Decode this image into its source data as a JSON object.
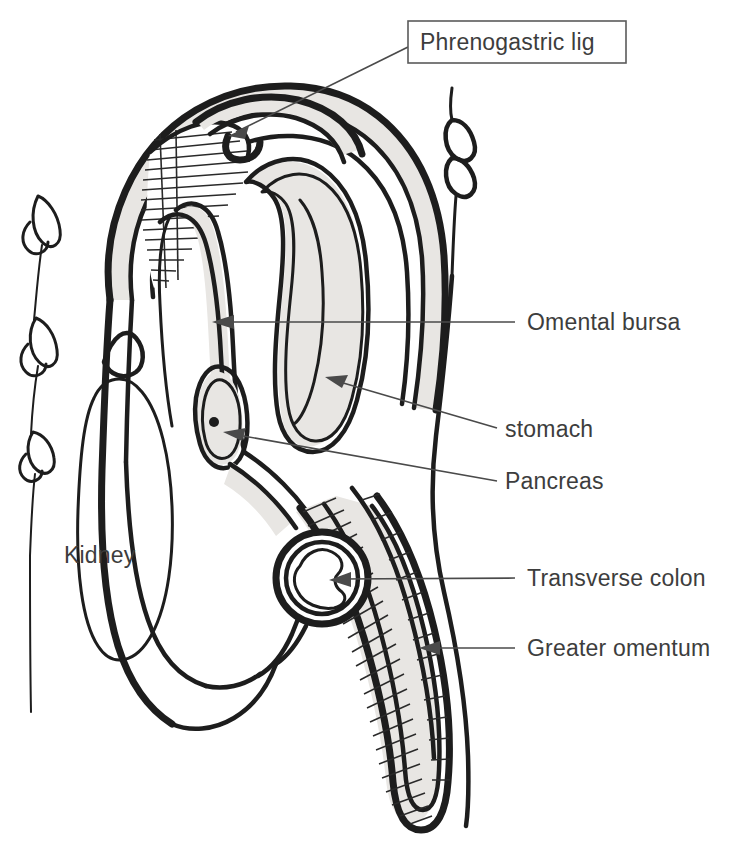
{
  "figure": {
    "background_color": "#ffffff",
    "ink_color": "#1d1d1d",
    "serosa_fill_color": "#e8e6e3",
    "label_text_color": "#3d3d3d",
    "labels": [
      {
        "id": "phrenogastric-lig",
        "text": "Phrenogastric lig",
        "boxed": true,
        "text_x": 420,
        "text_y": 48,
        "box": {
          "x": 408,
          "y": 21,
          "width": 218,
          "height": 42
        },
        "leader": {
          "x1": 408,
          "y1": 47,
          "x2": 231,
          "y2": 134
        },
        "anchor": "start"
      },
      {
        "id": "omental-bursa",
        "text": "Omental bursa",
        "boxed": false,
        "text_x": 527,
        "text_y": 330,
        "leader": {
          "x1": 515,
          "y1": 322,
          "x2": 214,
          "y2": 322
        },
        "anchor": "start"
      },
      {
        "id": "stomach",
        "text": "stomach",
        "boxed": false,
        "text_x": 505,
        "text_y": 437,
        "leader": {
          "x1": 497,
          "y1": 428,
          "x2": 327,
          "y2": 378
        },
        "anchor": "start"
      },
      {
        "id": "pancreas",
        "text": "Pancreas",
        "boxed": false,
        "text_x": 505,
        "text_y": 489,
        "leader": {
          "x1": 497,
          "y1": 481,
          "x2": 224,
          "y2": 432
        },
        "anchor": "start"
      },
      {
        "id": "transverse-colon",
        "text": "Transverse colon",
        "boxed": false,
        "text_x": 527,
        "text_y": 586,
        "leader": {
          "x1": 515,
          "y1": 578,
          "x2": 331,
          "y2": 580
        },
        "anchor": "start"
      },
      {
        "id": "greater-omentum",
        "text": "Greater omentum",
        "boxed": false,
        "text_x": 527,
        "text_y": 656,
        "leader": {
          "x1": 515,
          "y1": 648,
          "x2": 421,
          "y2": 648
        },
        "anchor": "start"
      },
      {
        "id": "kidney",
        "text": "Kidney",
        "boxed": false,
        "text_x": 64,
        "text_y": 563,
        "leader": null,
        "anchor": "start"
      }
    ],
    "structures": [
      "vertebral-spinous-processes-left",
      "anterior-abdominal-wall-right",
      "diaphragm",
      "phrenogastric-ligament-hatched",
      "stomach",
      "omental-bursa",
      "pancreas",
      "kidney",
      "suprarenal-gland",
      "transverse-colon",
      "greater-omentum",
      "peritoneum"
    ]
  }
}
